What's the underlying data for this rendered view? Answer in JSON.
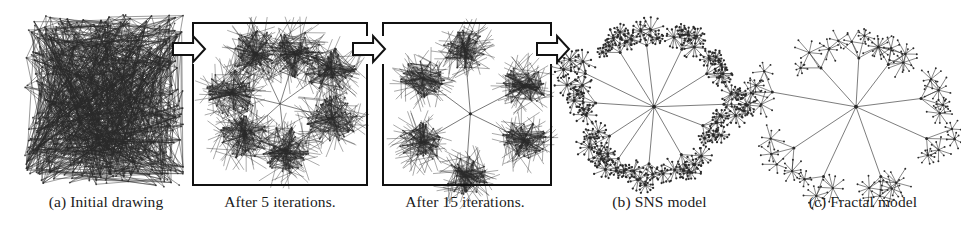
{
  "figure": {
    "width": 961,
    "height": 232,
    "background": "#ffffff",
    "ink": "#1b1b1b",
    "line_color": "#2a2a2a",
    "box_border_color": "#111111",
    "arrow_fill": "#ffffff",
    "arrow_stroke": "#111111"
  },
  "panels": [
    {
      "id": "initial-drawing",
      "caption": "(a) Initial drawing",
      "caption_x": 16,
      "caption_y": 193,
      "caption_width": 180,
      "art": {
        "x": 30,
        "y": 20,
        "width": 148,
        "height": 162,
        "type": "hairball"
      },
      "boxed": false,
      "graph": {
        "type": "random-hairball",
        "nodes": 480,
        "edges": 1100,
        "seed": 17,
        "description": "Dense uniformly random node placement inside a square; edges drawn as straight dark segments producing a solid scribble block."
      }
    },
    {
      "id": "after-5-iterations",
      "caption": "After 5 iterations.",
      "caption_x": 190,
      "caption_y": 193,
      "caption_width": 180,
      "art": {
        "x": 192,
        "y": 22,
        "width": 176,
        "height": 164,
        "type": "clusters"
      },
      "boxed": true,
      "graph": {
        "type": "partially-untangled",
        "seed": 91,
        "clusters": 7,
        "cluster_nodes": 58,
        "cluster_spread": 26,
        "hub_links": true,
        "description": "Seven dense hairy blobs loosely arranged around a faint centre; inter-cluster edges still long and crossing."
      }
    },
    {
      "id": "after-15-iterations",
      "caption": "After 15 iterations.",
      "caption_x": 370,
      "caption_y": 193,
      "caption_width": 190,
      "art": {
        "x": 382,
        "y": 22,
        "width": 170,
        "height": 164,
        "type": "radial-clusters"
      },
      "boxed": true,
      "graph": {
        "type": "radial-clusters",
        "seed": 205,
        "clusters": 6,
        "cluster_nodes": 52,
        "cluster_spread": 22,
        "hub_radius": 62,
        "description": "Six compact hairy clusters on a ring joined by clean straight spokes to one central hub."
      }
    },
    {
      "id": "sns-model",
      "caption": "(b) SNS model",
      "caption_x": 572,
      "caption_y": 193,
      "caption_width": 175,
      "art": {
        "x": 556,
        "y": 6,
        "width": 196,
        "height": 180,
        "type": "star-of-stars"
      },
      "boxed": false,
      "graph": {
        "type": "star-of-stars",
        "seed": 333,
        "hub_spokes": 12,
        "hub_radius": 66,
        "sub_hubs_per_spoke": 4,
        "leaf_count": 11,
        "leaf_radius": 9,
        "dense": true,
        "description": "Central hub with long spokes to mid hubs; every mid hub carries a tight rosette of small filled star clusters, heavily filled in."
      }
    },
    {
      "id": "fractal-model",
      "caption": "(c) Fractal model",
      "caption_x": 768,
      "caption_y": 193,
      "caption_width": 190,
      "art": {
        "x": 756,
        "y": 6,
        "width": 200,
        "height": 180,
        "type": "fractal-star"
      },
      "boxed": false,
      "graph": {
        "type": "fractal-star",
        "seed": 777,
        "hub_spokes": 9,
        "hub_radius": 72,
        "sub_hubs_per_spoke": 3,
        "leaf_count": 8,
        "leaf_radius": 11,
        "dense": false,
        "description": "Central hub with nine spokes; sparser self-similar star clusters, more open spacing, a few dark blobs."
      }
    }
  ],
  "arrows": [
    {
      "id": "arrow-1",
      "x": 172,
      "y": 34,
      "width": 34,
      "height": 30,
      "label": "arrow-right"
    },
    {
      "id": "arrow-2",
      "x": 352,
      "y": 34,
      "width": 34,
      "height": 30,
      "label": "arrow-right"
    },
    {
      "id": "arrow-3",
      "x": 536,
      "y": 34,
      "width": 34,
      "height": 30,
      "label": "arrow-right"
    }
  ]
}
